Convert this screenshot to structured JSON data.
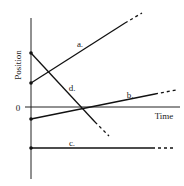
{
  "diagram": {
    "y_axis_label": "Position",
    "x_axis_label": "Time",
    "origin_label": "0",
    "lines": [
      {
        "id": "a",
        "label": "a.",
        "start": "positive",
        "slope": "positive",
        "description": "starts above zero, moves upward"
      },
      {
        "id": "b",
        "label": "b.",
        "start": "negative",
        "slope": "positive (small)",
        "description": "starts below zero, gently rising, crosses zero"
      },
      {
        "id": "c",
        "label": "c.",
        "start": "negative",
        "slope": "zero",
        "description": "horizontal line below zero"
      },
      {
        "id": "d",
        "label": "d.",
        "start": "positive (highest)",
        "slope": "negative",
        "description": "starts highest, decreases, crosses zero"
      }
    ],
    "colors": {
      "ink": "#111111",
      "background": "#ffffff"
    }
  }
}
